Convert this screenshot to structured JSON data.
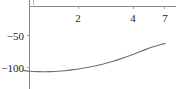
{
  "figure": {
    "width": 176,
    "height": 89,
    "background": "#ffffff",
    "axis_color": "#8a8a8a",
    "curve_color": "#6e6e6e",
    "text_color": "#1a1a1a"
  },
  "chart_data": {
    "type": "line",
    "title": "",
    "xlabel": "",
    "ylabel": "",
    "xlim": [
      0,
      5.4
    ],
    "ylim": [
      -108,
      2
    ],
    "grid": false,
    "legend": null,
    "axis_position": {
      "x_axis_at_y": 0,
      "y_axis_at_x": 0
    },
    "xticks": [
      {
        "value": 2,
        "label": "2"
      },
      {
        "value": 4,
        "label": "4"
      },
      {
        "value": 5.1,
        "label": "7"
      }
    ],
    "yticks": [
      {
        "value": -50,
        "label": "−50"
      },
      {
        "value": -100,
        "label": "−100"
      }
    ],
    "series": [
      {
        "name": "curve",
        "x": [
          0.0,
          0.25,
          0.5,
          0.75,
          1.0,
          1.25,
          1.5,
          1.75,
          2.0,
          2.25,
          2.5,
          2.75,
          3.0,
          3.25,
          3.5,
          3.75,
          4.0,
          4.25,
          4.5,
          4.75,
          5.0,
          5.15
        ],
        "y": [
          -100.0,
          -101.2,
          -101.8,
          -102.0,
          -101.8,
          -101.2,
          -100.3,
          -99.1,
          -97.6,
          -95.8,
          -93.7,
          -91.3,
          -88.6,
          -85.6,
          -82.2,
          -78.5,
          -74.5,
          -70.2,
          -66.2,
          -62.6,
          -59.4,
          -57.8
        ]
      }
    ]
  }
}
